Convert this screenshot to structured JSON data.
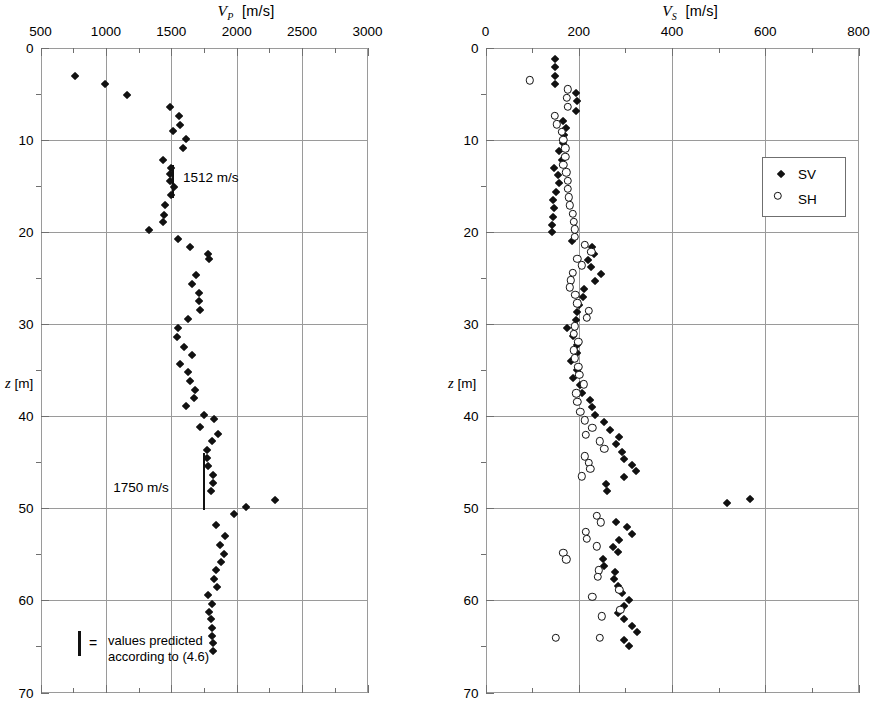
{
  "chart_data": [
    {
      "type": "scatter",
      "id": "vp-profile",
      "title": "V_P  [m/s]",
      "title_symbol": "V",
      "title_subscript": "P",
      "title_units": "[m/s]",
      "xlabel": "V_P [m/s]",
      "ylabel": "z [m]",
      "ylabel_symbol": "z",
      "ylabel_units": "[m]",
      "xlim": [
        500,
        3000
      ],
      "ylim": [
        0,
        70
      ],
      "y_inverted": true,
      "grid": true,
      "xticks": [
        500,
        1000,
        1500,
        2000,
        2500,
        3000
      ],
      "xtick_labels": [
        "500",
        "1000",
        "1500",
        "2000",
        "2500",
        "3000"
      ],
      "x_minor_step": 250,
      "yticks": [
        0,
        10,
        20,
        30,
        40,
        50,
        60,
        70
      ],
      "ytick_labels": [
        "0",
        "10",
        "20",
        "30",
        "40",
        "50",
        "60",
        "70"
      ],
      "y_minor_step": 5,
      "series": [
        {
          "name": "VP",
          "marker": "filled-diamond",
          "color": "#111111",
          "points": [
            [
              770,
              3.2
            ],
            [
              1000,
              4.1
            ],
            [
              1170,
              5.3
            ],
            [
              1500,
              6.6
            ],
            [
              1570,
              7.6
            ],
            [
              1580,
              8.5
            ],
            [
              1520,
              9.2
            ],
            [
              1620,
              10.1
            ],
            [
              1600,
              11.0
            ],
            [
              1450,
              12.3
            ],
            [
              1505,
              13.2
            ],
            [
              1500,
              13.9
            ],
            [
              1500,
              14.6
            ],
            [
              1530,
              15.3
            ],
            [
              1505,
              16.1
            ],
            [
              1460,
              17.2
            ],
            [
              1455,
              18.3
            ],
            [
              1450,
              19.1
            ],
            [
              1340,
              20.0
            ],
            [
              1560,
              20.9
            ],
            [
              1650,
              21.8
            ],
            [
              1790,
              22.6
            ],
            [
              1800,
              23.1
            ],
            [
              1700,
              24.8
            ],
            [
              1670,
              25.8
            ],
            [
              1720,
              26.8
            ],
            [
              1720,
              27.7
            ],
            [
              1730,
              28.6
            ],
            [
              1640,
              29.6
            ],
            [
              1560,
              30.6
            ],
            [
              1555,
              31.6
            ],
            [
              1610,
              32.6
            ],
            [
              1670,
              33.5
            ],
            [
              1575,
              34.5
            ],
            [
              1640,
              35.4
            ],
            [
              1650,
              36.3
            ],
            [
              1690,
              37.3
            ],
            [
              1680,
              38.2
            ],
            [
              1620,
              39.1
            ],
            [
              1760,
              40.0
            ],
            [
              1840,
              40.5
            ],
            [
              1730,
              41.3
            ],
            [
              1870,
              42.1
            ],
            [
              1820,
              42.9
            ],
            [
              1780,
              43.8
            ],
            [
              1780,
              44.7
            ],
            [
              1790,
              45.6
            ],
            [
              1830,
              46.5
            ],
            [
              1830,
              47.4
            ],
            [
              1810,
              48.3
            ],
            [
              2300,
              49.3
            ],
            [
              2080,
              50.0
            ],
            [
              1990,
              50.8
            ],
            [
              1850,
              52.0
            ],
            [
              1920,
              53.2
            ],
            [
              1880,
              54.1
            ],
            [
              1910,
              55.1
            ],
            [
              1890,
              56.0
            ],
            [
              1850,
              56.9
            ],
            [
              1840,
              57.8
            ],
            [
              1860,
              58.7
            ],
            [
              1790,
              59.6
            ],
            [
              1820,
              60.5
            ],
            [
              1800,
              61.4
            ],
            [
              1810,
              62.2
            ],
            [
              1820,
              63.1
            ],
            [
              1820,
              64.0
            ],
            [
              1825,
              64.8
            ],
            [
              1830,
              65.6
            ]
          ]
        }
      ],
      "annotations": [
        {
          "type": "predicted-bar",
          "label": "1512 m/s",
          "x": 1512,
          "y_start": 12.7,
          "y_end": 16.3,
          "label_x": 1590,
          "label_y": 14.0
        },
        {
          "type": "predicted-bar",
          "label": "1750 m/s",
          "x": 1750,
          "y_start": 44.0,
          "y_end": 50.2,
          "label_x": 1480,
          "label_y": 47.7
        }
      ],
      "legend": {
        "symbol": "vertical-bar",
        "equals": "=",
        "line1": "values predicted",
        "line2": "according to (4.6)"
      }
    },
    {
      "type": "scatter",
      "id": "vs-profile",
      "title": "V_S  [m/s]",
      "title_symbol": "V",
      "title_subscript": "S",
      "title_units": "[m/s]",
      "xlabel": "V_S [m/s]",
      "ylabel": "z [m]",
      "ylabel_symbol": "z",
      "ylabel_units": "[m]",
      "xlim": [
        0,
        800
      ],
      "ylim": [
        0,
        70
      ],
      "y_inverted": true,
      "grid": true,
      "xticks": [
        0,
        200,
        400,
        600,
        800
      ],
      "xtick_labels": [
        "0",
        "200",
        "400",
        "600",
        "800"
      ],
      "x_minor_step": 100,
      "yticks": [
        0,
        10,
        20,
        30,
        40,
        50,
        60,
        70
      ],
      "ytick_labels": [
        "0",
        "10",
        "20",
        "30",
        "40",
        "50",
        "60",
        "70"
      ],
      "y_minor_step": 5,
      "series": [
        {
          "name": "SV",
          "marker": "filled-diamond",
          "color": "#111111",
          "points": [
            [
              152,
              1.4
            ],
            [
              152,
              2.3
            ],
            [
              152,
              3.2
            ],
            [
              152,
              4.1
            ],
            [
              196,
              5.1
            ],
            [
              200,
              6.0
            ],
            [
              196,
              7.0
            ],
            [
              170,
              8.1
            ],
            [
              176,
              8.9
            ],
            [
              172,
              9.6
            ],
            [
              168,
              10.5
            ],
            [
              160,
              11.4
            ],
            [
              166,
              12.3
            ],
            [
              150,
              13.2
            ],
            [
              158,
              14.0
            ],
            [
              160,
              14.9
            ],
            [
              155,
              15.8
            ],
            [
              148,
              16.7
            ],
            [
              150,
              17.6
            ],
            [
              148,
              18.5
            ],
            [
              146,
              19.4
            ],
            [
              146,
              20.2
            ],
            [
              188,
              21.1
            ],
            [
              232,
              21.8
            ],
            [
              236,
              22.5
            ],
            [
              222,
              23.2
            ],
            [
              228,
              24.0
            ],
            [
              250,
              24.7
            ],
            [
              238,
              25.5
            ],
            [
              214,
              26.3
            ],
            [
              212,
              27.2
            ],
            [
              203,
              28.1
            ],
            [
              200,
              28.9
            ],
            [
              196,
              29.7
            ],
            [
              178,
              30.6
            ],
            [
              190,
              31.5
            ],
            [
              200,
              32.4
            ],
            [
              198,
              33.3
            ],
            [
              186,
              34.2
            ],
            [
              200,
              35.1
            ],
            [
              190,
              36.0
            ],
            [
              205,
              36.8
            ],
            [
              210,
              37.6
            ],
            [
              226,
              38.4
            ],
            [
              232,
              39.2
            ],
            [
              238,
              40.0
            ],
            [
              256,
              40.8
            ],
            [
              270,
              41.6
            ],
            [
              290,
              42.4
            ],
            [
              282,
              43.2
            ],
            [
              296,
              44.0
            ],
            [
              300,
              44.8
            ],
            [
              316,
              45.5
            ],
            [
              326,
              46.1
            ],
            [
              300,
              46.8
            ],
            [
              262,
              47.5
            ],
            [
              264,
              48.3
            ],
            [
              520,
              49.6
            ],
            [
              570,
              49.1
            ],
            [
              282,
              51.6
            ],
            [
              306,
              52.2
            ],
            [
              318,
              52.9
            ],
            [
              290,
              53.6
            ],
            [
              276,
              54.3
            ],
            [
              286,
              54.9
            ],
            [
              254,
              55.6
            ],
            [
              258,
              56.4
            ],
            [
              280,
              57.1
            ],
            [
              278,
              57.8
            ],
            [
              288,
              58.6
            ],
            [
              296,
              59.3
            ],
            [
              310,
              60.1
            ],
            [
              300,
              60.8
            ],
            [
              286,
              61.5
            ],
            [
              300,
              62.2
            ],
            [
              316,
              62.9
            ],
            [
              328,
              63.6
            ],
            [
              300,
              64.4
            ],
            [
              310,
              65.1
            ]
          ]
        },
        {
          "name": "SH",
          "marker": "open-circle",
          "color": "#111111",
          "points": [
            [
              104,
              4.0
            ],
            [
              186,
              5.0
            ],
            [
              184,
              5.9
            ],
            [
              186,
              6.9
            ],
            [
              158,
              7.9
            ],
            [
              162,
              8.8
            ],
            [
              172,
              9.6
            ],
            [
              176,
              10.5
            ],
            [
              180,
              11.4
            ],
            [
              180,
              12.3
            ],
            [
              176,
              13.2
            ],
            [
              182,
              14.0
            ],
            [
              186,
              14.9
            ],
            [
              186,
              15.8
            ],
            [
              188,
              16.7
            ],
            [
              190,
              17.6
            ],
            [
              196,
              18.5
            ],
            [
              198,
              19.4
            ],
            [
              200,
              20.2
            ],
            [
              200,
              21.0
            ],
            [
              222,
              21.9
            ],
            [
              236,
              22.6
            ],
            [
              206,
              23.4
            ],
            [
              216,
              24.1
            ],
            [
              196,
              24.9
            ],
            [
              192,
              25.7
            ],
            [
              190,
              26.5
            ],
            [
              202,
              27.3
            ],
            [
              206,
              28.2
            ],
            [
              230,
              29.0
            ],
            [
              226,
              29.8
            ],
            [
              200,
              30.7
            ],
            [
              198,
              31.5
            ],
            [
              208,
              32.4
            ],
            [
              198,
              33.3
            ],
            [
              200,
              34.2
            ],
            [
              208,
              35.1
            ],
            [
              210,
              36.0
            ],
            [
              220,
              37.0
            ],
            [
              204,
              38.0
            ],
            [
              206,
              38.9
            ],
            [
              212,
              40.0
            ],
            [
              222,
              40.9
            ],
            [
              238,
              41.7
            ],
            [
              224,
              42.5
            ],
            [
              254,
              43.2
            ],
            [
              264,
              44.0
            ],
            [
              222,
              44.8
            ],
            [
              230,
              45.5
            ],
            [
              234,
              46.2
            ],
            [
              216,
              47.0
            ],
            [
              248,
              51.3
            ],
            [
              256,
              52.0
            ],
            [
              224,
              53.0
            ],
            [
              226,
              53.8
            ],
            [
              248,
              54.6
            ],
            [
              176,
              55.3
            ],
            [
              182,
              56.0
            ],
            [
              252,
              57.2
            ],
            [
              250,
              57.9
            ],
            [
              296,
              59.3
            ],
            [
              238,
              60.1
            ],
            [
              298,
              61.5
            ],
            [
              258,
              62.2
            ],
            [
              160,
              64.5
            ],
            [
              254,
              64.5
            ]
          ]
        }
      ],
      "legend": {
        "position": "top-right",
        "entries": [
          {
            "label": "SV",
            "marker": "filled-diamond"
          },
          {
            "label": "SH",
            "marker": "open-circle"
          }
        ]
      }
    }
  ]
}
